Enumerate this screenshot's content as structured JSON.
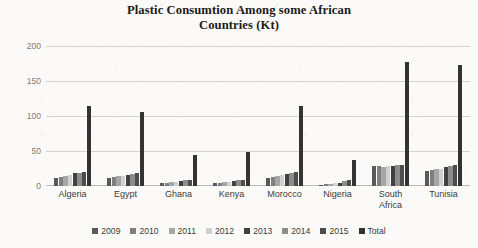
{
  "chart_data": {
    "type": "bar",
    "title": "Plastic Consumtion Among some African Countries (Kt)",
    "title_line1": "Plastic Consumtion Among some African",
    "title_line2": "Countries (Kt)",
    "xlabel": "",
    "ylabel": "",
    "ylim": [
      0,
      200
    ],
    "yticks": [
      0,
      50,
      100,
      150,
      200
    ],
    "ytick_labels": [
      "0",
      "50",
      "100",
      "150",
      "200"
    ],
    "grid": true,
    "legend_position": "bottom",
    "categories": [
      "Algeria",
      "Egypt",
      "Ghana",
      "Kenya",
      "Morocco",
      "Nigeria",
      "South Africa",
      "Tunisia"
    ],
    "category_lines": [
      [
        "Algeria"
      ],
      [
        "Egypt"
      ],
      [
        "Ghana"
      ],
      [
        "Kenya"
      ],
      [
        "Morocco"
      ],
      [
        "Nigeria"
      ],
      [
        "South",
        "Africa"
      ],
      [
        "Tunisia"
      ]
    ],
    "series": [
      {
        "name": "2009",
        "color": "#595959",
        "values": [
          12,
          12,
          4,
          4,
          12,
          2,
          28,
          22
        ]
      },
      {
        "name": "2010",
        "color": "#7f7f7f",
        "values": [
          13,
          13,
          5,
          5,
          13,
          3,
          28,
          23
        ]
      },
      {
        "name": "2011",
        "color": "#a6a6a6",
        "values": [
          15,
          14,
          6,
          6,
          15,
          3,
          27,
          24
        ]
      },
      {
        "name": "2012",
        "color": "#d0d0d0",
        "values": [
          16,
          15,
          6,
          6,
          16,
          4,
          29,
          25
        ]
      },
      {
        "name": "2013",
        "color": "#404040",
        "values": [
          18,
          16,
          7,
          7,
          17,
          5,
          29,
          27
        ]
      },
      {
        "name": "2014",
        "color": "#8c8c8c",
        "values": [
          19,
          17,
          8,
          8,
          19,
          7,
          30,
          28
        ]
      },
      {
        "name": "2015",
        "color": "#4d4d4d",
        "values": [
          20,
          18,
          9,
          9,
          20,
          8,
          30,
          30
        ]
      },
      {
        "name": "Total",
        "color": "#333333",
        "values": [
          115,
          106,
          45,
          48,
          114,
          37,
          177,
          173
        ]
      }
    ]
  },
  "legend": {
    "items": [
      {
        "label": "2009",
        "color": "#595959"
      },
      {
        "label": "2010",
        "color": "#7f7f7f"
      },
      {
        "label": "2011",
        "color": "#a6a6a6"
      },
      {
        "label": "2012",
        "color": "#d0d0d0"
      },
      {
        "label": "2013",
        "color": "#404040"
      },
      {
        "label": "2014",
        "color": "#8c8c8c"
      },
      {
        "label": "2015",
        "color": "#4d4d4d"
      },
      {
        "label": "Total",
        "color": "#333333"
      }
    ]
  },
  "colors": {
    "background": "#fbfaf8",
    "gridline": "#d2d2d2",
    "axis_text": "#7a7a7a",
    "label_text": "#3a3a3a",
    "title_text": "#1b1b1b"
  }
}
